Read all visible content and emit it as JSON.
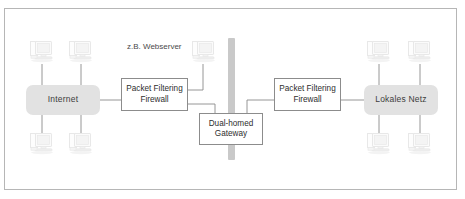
{
  "diagram": {
    "background_color": "#ffffff",
    "frame_color": "#b6b6b6",
    "group_fill_color": "#e2e2e2",
    "box_border_color": "#8c8c8c",
    "wire_color": "#8a8a8a",
    "dmz_bar_color": "#c9c9c9",
    "icon_color": "#e8e8e8"
  },
  "nodes": {
    "internet": {
      "label": "Internet",
      "x": 26,
      "y": 85,
      "w": 74,
      "h": 30
    },
    "local_network": {
      "label": "Lokales Netz",
      "x": 364,
      "y": 85,
      "w": 74,
      "h": 30
    },
    "firewall_left": {
      "label_line1": "Packet Filtering",
      "label_line2": "Firewall",
      "x": 121,
      "y": 78,
      "w": 67,
      "h": 33
    },
    "firewall_right": {
      "label_line1": "Packet Filtering",
      "label_line2": "Firewall",
      "x": 274,
      "y": 78,
      "w": 67,
      "h": 33
    },
    "gateway": {
      "label_line1": "Dual-homed",
      "label_line2": "Gateway",
      "x": 199,
      "y": 113,
      "w": 64,
      "h": 32
    }
  },
  "dmz_bar": {
    "x": 228,
    "y": 38,
    "w": 7,
    "h": 122
  },
  "annotations": [
    {
      "id": "webserver-label",
      "text": "z.B. Webserver",
      "x": 127,
      "y": 42
    }
  ],
  "workstations": [
    {
      "id": "internet-host-top-left",
      "x": 29,
      "y": 40
    },
    {
      "id": "internet-host-top-right",
      "x": 68,
      "y": 40
    },
    {
      "id": "internet-host-bottom-left",
      "x": 29,
      "y": 132
    },
    {
      "id": "internet-host-bottom-right",
      "x": 68,
      "y": 132
    },
    {
      "id": "dmz-webserver-host",
      "x": 191,
      "y": 40
    },
    {
      "id": "lan-host-top-left",
      "x": 366,
      "y": 40
    },
    {
      "id": "lan-host-top-right",
      "x": 407,
      "y": 40
    },
    {
      "id": "lan-host-bottom-left",
      "x": 366,
      "y": 132
    },
    {
      "id": "lan-host-bottom-right",
      "x": 407,
      "y": 132
    }
  ],
  "wires": [
    {
      "id": "internet-host-top-left-link",
      "d": "M 42 64 L 42 85"
    },
    {
      "id": "internet-host-top-right-link",
      "d": "M 81 64 L 81 85"
    },
    {
      "id": "internet-host-bottom-left-link",
      "d": "M 42 115 L 42 136"
    },
    {
      "id": "internet-host-bottom-right-link",
      "d": "M 81 115 L 81 136"
    },
    {
      "id": "internet-to-firewall-left",
      "d": "M 100 100 L 121 100"
    },
    {
      "id": "firewall-left-to-webserver",
      "d": "M 188 90 L 203 90 L 203 64"
    },
    {
      "id": "firewall-left-to-gateway",
      "d": "M 188 104 L 215 104 L 215 113"
    },
    {
      "id": "gateway-to-firewall-right",
      "d": "M 247 113 L 247 100 L 274 100"
    },
    {
      "id": "firewall-right-to-local-network",
      "d": "M 341 100 L 364 100"
    },
    {
      "id": "lan-host-top-left-link",
      "d": "M 379 64 L 379 85"
    },
    {
      "id": "lan-host-top-right-link",
      "d": "M 420 64 L 420 85"
    },
    {
      "id": "lan-host-bottom-left-link",
      "d": "M 379 115 L 379 136"
    },
    {
      "id": "lan-host-bottom-right-link",
      "d": "M 420 115 L 420 136"
    }
  ]
}
